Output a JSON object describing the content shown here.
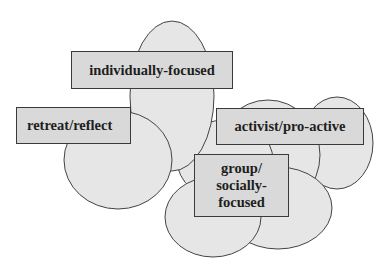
{
  "diagram": {
    "type": "overlapping-ellipse-cluster",
    "colors": {
      "ellipse_fill": "#e6e6e6",
      "ellipse_stroke": "#444444",
      "box_fill": "#d9d9d9",
      "box_stroke": "#3a3a3a",
      "text": "#1e1e1e",
      "background": "#ffffff"
    },
    "labels": {
      "individually_focused": "individually-focused",
      "retreat_reflect": "retreat/reflect",
      "activist_pro_active": "activist/pro-active",
      "group_line1": "group/",
      "group_line2": "socially-",
      "group_line3": "focused"
    }
  }
}
